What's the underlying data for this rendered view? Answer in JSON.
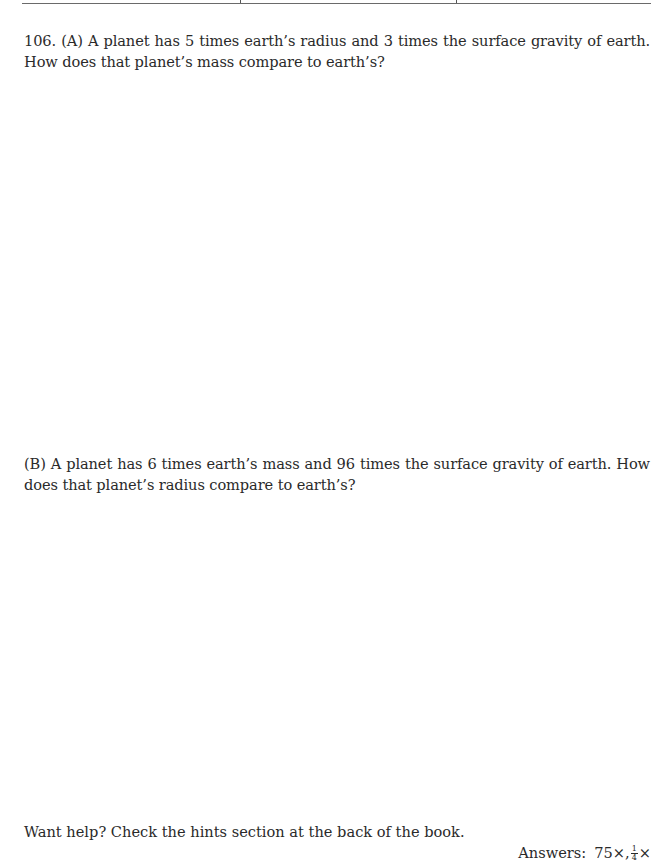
{
  "header": {
    "rule": true
  },
  "problem": {
    "number": "106.",
    "part_a": {
      "label": "(A)",
      "text": "106.  (A) A planet has 5 times earth’s radius and 3 times the surface gravity of earth.  How does that planet’s mass compare to earth’s?"
    },
    "part_b": {
      "label": "(B)",
      "text": "(B) A planet has 6 times earth’s mass and 96 times the surface gravity of earth.  How does that planet’s radius compare to earth’s?"
    }
  },
  "footer": {
    "hint": "Want help?  Check the hints section at the back of the book.",
    "answers_label": "Answers:",
    "answer_1": "75×,",
    "answer_2_numerator": "1",
    "answer_2_denominator": "4",
    "answer_2_suffix": "×"
  }
}
